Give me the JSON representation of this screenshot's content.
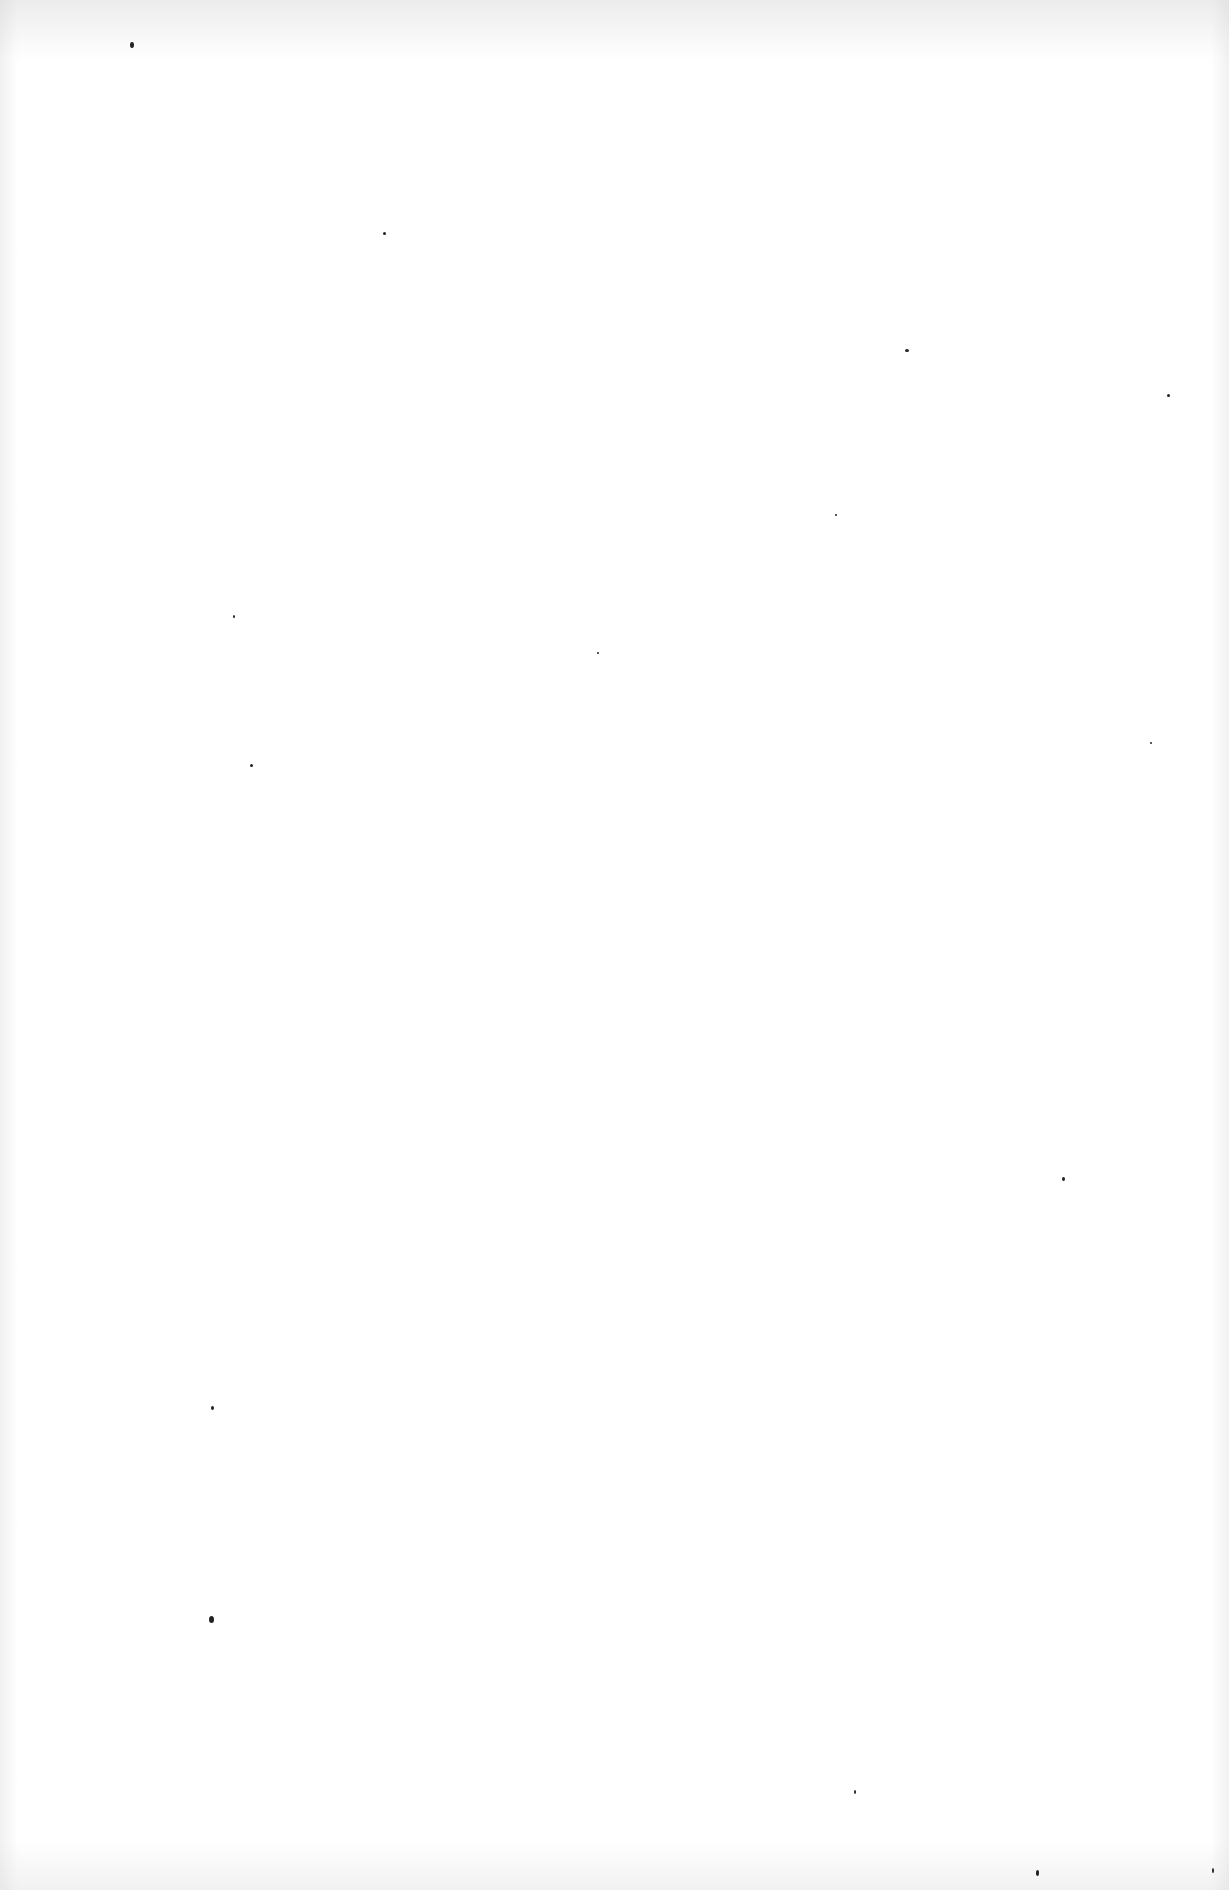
{
  "page": {
    "background": "#ffffff",
    "speck_color": "#222222",
    "specks": [
      {
        "x": 130,
        "y": 42,
        "w": 4,
        "h": 6
      },
      {
        "x": 383,
        "y": 232,
        "w": 3,
        "h": 3
      },
      {
        "x": 905,
        "y": 349,
        "w": 4,
        "h": 3
      },
      {
        "x": 1167,
        "y": 394,
        "w": 3,
        "h": 3
      },
      {
        "x": 835,
        "y": 514,
        "w": 2,
        "h": 2
      },
      {
        "x": 233,
        "y": 615,
        "w": 2,
        "h": 3
      },
      {
        "x": 597,
        "y": 652,
        "w": 2,
        "h": 2
      },
      {
        "x": 250,
        "y": 764,
        "w": 3,
        "h": 3
      },
      {
        "x": 1150,
        "y": 742,
        "w": 2,
        "h": 2
      },
      {
        "x": 1062,
        "y": 1177,
        "w": 3,
        "h": 4
      },
      {
        "x": 211,
        "y": 1406,
        "w": 3,
        "h": 4
      },
      {
        "x": 209,
        "y": 1616,
        "w": 5,
        "h": 7
      },
      {
        "x": 854,
        "y": 1790,
        "w": 2,
        "h": 4
      },
      {
        "x": 1036,
        "y": 1870,
        "w": 3,
        "h": 6
      },
      {
        "x": 1212,
        "y": 1868,
        "w": 2,
        "h": 5
      }
    ]
  }
}
